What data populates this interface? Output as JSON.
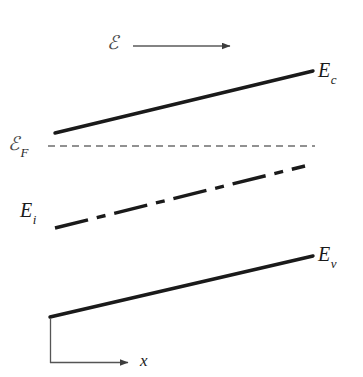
{
  "figure": {
    "background_color": "#ffffff",
    "width": 363,
    "height": 377
  },
  "labels": {
    "field": {
      "symbol": "ℰ",
      "subscript": "",
      "name": "electric-field"
    },
    "conduction_band": {
      "symbol": "E",
      "subscript": "c",
      "name": "conduction-band-edge"
    },
    "fermi_level": {
      "symbol": "ℰ",
      "subscript": "F",
      "name": "fermi-level"
    },
    "intrinsic_level": {
      "symbol": "E",
      "subscript": "i",
      "name": "intrinsic-level"
    },
    "valence_band": {
      "symbol": "E",
      "subscript": "v",
      "name": "valence-band-edge"
    },
    "axis_x": {
      "symbol": "x",
      "name": "position-axis"
    }
  },
  "colors": {
    "band_line": "#1a1a1a",
    "fermi_line": "#6e6e6e",
    "field_arrow": "#5a5a5a",
    "axis": "#555555",
    "text": "#1a1a1a",
    "script_text": "#4a4a4a"
  },
  "chart_data": {
    "type": "line",
    "xlabel": "x",
    "ylabel": "",
    "grid": false,
    "legend": "none",
    "note": "Energy bands tilt upward with increasing x due to the applied electric field; the Fermi level remains flat.",
    "axis_ranges": {
      "x_px": [
        50,
        320
      ],
      "y_px": [
        60,
        363
      ]
    },
    "series": [
      {
        "name": "E_c",
        "label": "E_c",
        "style": "solid",
        "width": 3.4,
        "color": "#1a1a1a",
        "points": [
          [
            55,
            133
          ],
          [
            313,
            71
          ]
        ]
      },
      {
        "name": "E_F",
        "label": "ℰ_F",
        "style": "dashed",
        "width": 1.3,
        "color": "#6e6e6e",
        "dasharray": "7,5",
        "points": [
          [
            48,
            146
          ],
          [
            315,
            146
          ]
        ]
      },
      {
        "name": "E_i",
        "label": "E_i",
        "style": "dash-dot",
        "width": 3.4,
        "color": "#1a1a1a",
        "dasharray": "34,9,9,9",
        "points": [
          [
            55,
            228
          ],
          [
            305,
            166
          ]
        ]
      },
      {
        "name": "E_v",
        "label": "E_v",
        "style": "solid",
        "width": 3.4,
        "color": "#1a1a1a",
        "points": [
          [
            50,
            317
          ],
          [
            313,
            256
          ]
        ]
      }
    ],
    "annotations": [
      {
        "name": "field-arrow",
        "label": "ℰ",
        "type": "arrow",
        "from": [
          133,
          46
        ],
        "to": [
          232,
          46
        ],
        "color": "#5a5a5a"
      },
      {
        "name": "x-axis",
        "type": "axis",
        "vertical": [
          [
            50,
            318
          ],
          [
            50,
            363
          ]
        ],
        "horizontal": [
          [
            50,
            363
          ],
          [
            130,
            363
          ]
        ],
        "arrow_at": "horizontal-end",
        "color": "#555555"
      }
    ]
  }
}
